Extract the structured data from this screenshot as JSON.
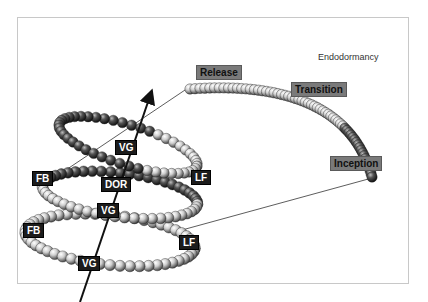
{
  "title": "Endodormancy",
  "phase_labels": {
    "release": "Release",
    "transition": "Transition",
    "inception": "Inception"
  },
  "cycle_labels": [
    {
      "id": "vg-top",
      "text": "VG"
    },
    {
      "id": "fb-upper",
      "text": "FB"
    },
    {
      "id": "dor",
      "text": "DOR"
    },
    {
      "id": "lf-upper",
      "text": "LF"
    },
    {
      "id": "vg-middle",
      "text": "VG"
    },
    {
      "id": "fb-lower",
      "text": "FB"
    },
    {
      "id": "lf-lower",
      "text": "LF"
    },
    {
      "id": "vg-bottom",
      "text": "VG"
    }
  ],
  "colors": {
    "frame": "#c8c8c8",
    "dark_label_bg": "#1c1c1c",
    "gray_label_bg": "#7a7a7a",
    "bead_light": "#e8e8e8",
    "bead_dark": "#2a2a2a",
    "arrow": "#111111"
  }
}
